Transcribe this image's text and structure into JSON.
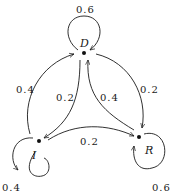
{
  "diagram": {
    "type": "markov-chain-state-diagram",
    "nodes": [
      {
        "id": "D",
        "label": "D"
      },
      {
        "id": "I",
        "label": "I"
      },
      {
        "id": "R",
        "label": "R"
      }
    ],
    "edges": [
      {
        "from": "D",
        "to": "D",
        "label": "0.6"
      },
      {
        "from": "I",
        "to": "I",
        "label": "0.4"
      },
      {
        "from": "R",
        "to": "R",
        "label": "0.6"
      },
      {
        "from": "I",
        "to": "D",
        "label": "0.4"
      },
      {
        "from": "D",
        "to": "I",
        "label": "0.2"
      },
      {
        "from": "R",
        "to": "D",
        "label": "0.4"
      },
      {
        "from": "D",
        "to": "R",
        "label": "0.2"
      },
      {
        "from": "I",
        "to": "R",
        "label": "0.2"
      }
    ]
  }
}
